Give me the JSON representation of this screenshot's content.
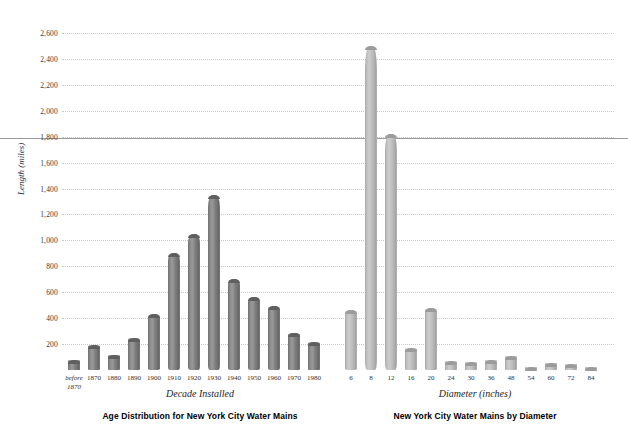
{
  "figure": {
    "background": "#ffffff",
    "grid_color": "#c9c9c9",
    "axis_color": "#9a9a9a"
  },
  "axis": {
    "ylabel": "Length (miles)",
    "yticks": [
      "200",
      "400",
      "600",
      "800",
      "1,000",
      "1,200",
      "1,400",
      "1,600",
      "1,800",
      "2,000",
      "2,200",
      "2,400",
      "2,600"
    ],
    "ymin": 0,
    "ymax": 2700
  },
  "chart_data": [
    {
      "type": "bar",
      "title": "Age Distribution for New York City Water Mains",
      "xlabel": "Decade Installed",
      "ylabel": "Length (miles)",
      "ylim": [
        0,
        2700
      ],
      "grid": true,
      "bar_color": "#7d7d7d",
      "categories": [
        "before\n1870",
        "1870",
        "1880",
        "1890",
        "1900",
        "1910",
        "1920",
        "1930",
        "1940",
        "1950",
        "1960",
        "1970",
        "1980"
      ],
      "values": [
        75,
        195,
        115,
        245,
        435,
        900,
        1050,
        1350,
        705,
        560,
        490,
        285,
        215
      ]
    },
    {
      "type": "bar",
      "title": "New York City Water Mains by Diameter",
      "xlabel": "Diameter (inches)",
      "ylabel": "Length (miles)",
      "ylim": [
        0,
        2700
      ],
      "grid": true,
      "bar_color": "#bcbcbc",
      "categories": [
        "6",
        "8",
        "12",
        "16",
        "20",
        "24",
        "30",
        "36",
        "48",
        "54",
        "60",
        "72",
        "84"
      ],
      "values": [
        460,
        2500,
        1820,
        170,
        480,
        70,
        65,
        80,
        105,
        25,
        55,
        45,
        22
      ]
    }
  ]
}
